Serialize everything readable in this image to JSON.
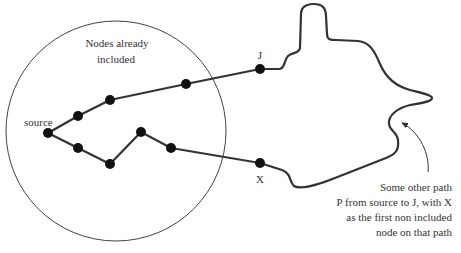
{
  "diagram": {
    "region_label_line1": "Nodes already",
    "region_label_line2": "included",
    "source_label": "source",
    "j_label": "J",
    "x_label": "X",
    "annotation": [
      "Some other path",
      "P from source to J, with X",
      "as the first non included",
      "node on that path"
    ],
    "colors": {
      "line": "#333333",
      "node": "#111111",
      "text": "#333333",
      "background": "#ffffff"
    },
    "nodes": [
      {
        "id": "source",
        "x": 48,
        "y": 133
      },
      {
        "id": "a1",
        "x": 78,
        "y": 116
      },
      {
        "id": "a2",
        "x": 110,
        "y": 100
      },
      {
        "id": "a3",
        "x": 186,
        "y": 84
      },
      {
        "id": "J",
        "x": 260,
        "y": 69
      },
      {
        "id": "b1",
        "x": 78,
        "y": 148
      },
      {
        "id": "b2",
        "x": 110,
        "y": 164
      },
      {
        "id": "b3",
        "x": 141,
        "y": 132
      },
      {
        "id": "b4",
        "x": 171,
        "y": 148
      },
      {
        "id": "X",
        "x": 260,
        "y": 163
      }
    ],
    "edges": [
      [
        "source",
        "a1"
      ],
      [
        "a1",
        "a2"
      ],
      [
        "a2",
        "a3"
      ],
      [
        "a3",
        "J"
      ],
      [
        "source",
        "b1"
      ],
      [
        "b1",
        "b2"
      ],
      [
        "b2",
        "b3"
      ],
      [
        "b3",
        "b4"
      ],
      [
        "b4",
        "X"
      ]
    ]
  }
}
